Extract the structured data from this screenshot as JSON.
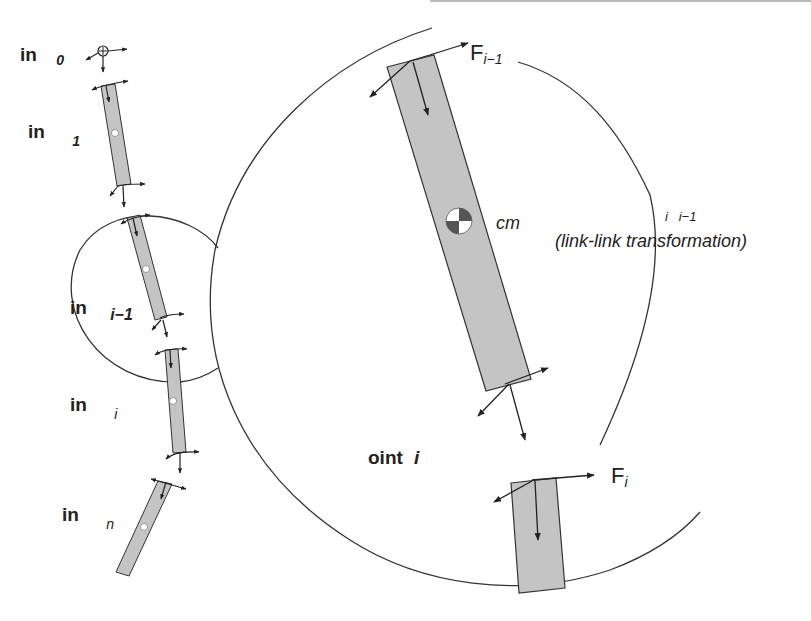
{
  "diagram": {
    "link_labels": [
      {
        "prefix": "in",
        "subscript": "0"
      },
      {
        "prefix": "in",
        "subscript": "1"
      },
      {
        "prefix": "in",
        "subscript": "i−1"
      },
      {
        "prefix": "in",
        "subscript": "i"
      },
      {
        "prefix": "in",
        "subscript": "n"
      }
    ],
    "detail": {
      "force_top": {
        "base": "F",
        "subscript": "i−1"
      },
      "force_bottom": {
        "base": "F",
        "subscript": "i"
      },
      "center_of_mass_label": "cm",
      "transform_indices": "i   i−1",
      "transform_label": "(link-link transformation)",
      "joint_label_prefix": "oint",
      "joint_label_index": "i"
    },
    "colors": {
      "link_fill": "#c4c4c4",
      "stroke": "#333333",
      "text": "#222222"
    }
  }
}
